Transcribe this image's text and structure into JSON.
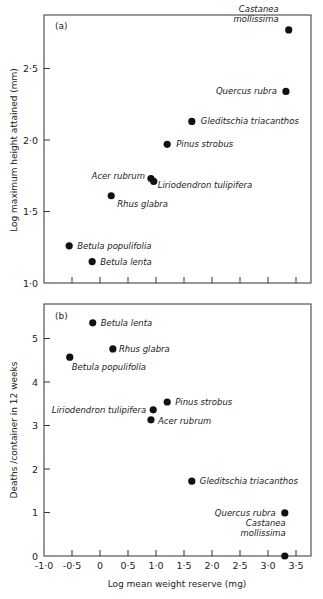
{
  "chart_data": [
    {
      "type": "scatter",
      "panel": "(a)",
      "title": "",
      "xlabel": "Log mean weight reserve (mg)",
      "ylabel": "Log maximum height attained (mm)",
      "xlim": [
        -1.0,
        3.75
      ],
      "ylim": [
        1.0,
        2.87
      ],
      "xticks": [
        -1.0,
        -0.5,
        0,
        0.5,
        1.0,
        1.5,
        2.0,
        2.5,
        3.0,
        3.5
      ],
      "yticks": [
        1.0,
        1.5,
        2.0,
        2.5
      ],
      "ytick_labels": [
        "1·0",
        "1·5",
        "2·0",
        "2·5"
      ],
      "grid": false,
      "legend": null,
      "points": [
        {
          "label": "Castanea mollissima",
          "label_lines": [
            "Castanea",
            "mollissima"
          ],
          "x": 3.37,
          "y": 2.77,
          "anchor": "end",
          "dx": -10,
          "dy": -8
        },
        {
          "label": "Quercus rubra",
          "label_lines": [
            "Quercus rubra"
          ],
          "x": 3.32,
          "y": 2.34,
          "anchor": "end",
          "dx": -9,
          "dy": 3
        },
        {
          "label": "Gleditschia triacanthos",
          "label_lines": [
            "Gleditschia triacanthos"
          ],
          "x": 1.64,
          "y": 2.13,
          "anchor": "start",
          "dx": 9,
          "dy": 3
        },
        {
          "label": "Pinus strobus",
          "label_lines": [
            "Pinus strobus"
          ],
          "x": 1.2,
          "y": 1.97,
          "anchor": "start",
          "dx": 9,
          "dy": 3
        },
        {
          "label": "Acer rubrum",
          "label_lines": [
            "Acer rubrum"
          ],
          "x": 0.91,
          "y": 1.73,
          "anchor": "end",
          "dx": -6,
          "dy": 0
        },
        {
          "label": "Liriodendron tulipifera",
          "label_lines": [
            "Liriodendron tulipifera"
          ],
          "x": 0.96,
          "y": 1.71,
          "anchor": "start",
          "dx": 4,
          "dy": 7
        },
        {
          "label": "Rhus glabra",
          "label_lines": [
            "Rhus glabra"
          ],
          "x": 0.2,
          "y": 1.61,
          "anchor": "start",
          "dx": 6,
          "dy": 11
        },
        {
          "label": "Betula populifolia",
          "label_lines": [
            "Betula populifolia"
          ],
          "x": -0.55,
          "y": 1.26,
          "anchor": "start",
          "dx": 8,
          "dy": 3
        },
        {
          "label": "Betula lenta",
          "label_lines": [
            "Betula lenta"
          ],
          "x": -0.14,
          "y": 1.15,
          "anchor": "start",
          "dx": 8,
          "dy": 3
        }
      ]
    },
    {
      "type": "scatter",
      "panel": "(b)",
      "title": "",
      "xlabel": "Log mean weight reserve (mg)",
      "ylabel": "Deaths /container in 12 weeks",
      "xlim": [
        -1.0,
        3.75
      ],
      "ylim": [
        0,
        5.8
      ],
      "xticks": [
        -1.0,
        -0.5,
        0,
        0.5,
        1.0,
        1.5,
        2.0,
        2.5,
        3.0,
        3.5
      ],
      "xtick_labels": [
        "-1·0",
        "-0·5",
        "0",
        "0·5",
        "1·0",
        "1·5",
        "2·0",
        "2·5",
        "3·0",
        "3·5"
      ],
      "yticks": [
        0,
        1,
        2,
        3,
        4,
        5
      ],
      "ytick_labels": [
        "0",
        "1",
        "2",
        "3",
        "4",
        "5"
      ],
      "grid": false,
      "legend": null,
      "points": [
        {
          "label": "Betula lenta",
          "label_lines": [
            "Betula lenta"
          ],
          "x": -0.13,
          "y": 5.36,
          "anchor": "start",
          "dx": 8,
          "dy": 3
        },
        {
          "label": "Rhus glabra",
          "label_lines": [
            "Rhus glabra"
          ],
          "x": 0.23,
          "y": 4.76,
          "anchor": "start",
          "dx": 6,
          "dy": 3
        },
        {
          "label": "Betula populifolia",
          "label_lines": [
            "Betula populifolia"
          ],
          "x": -0.54,
          "y": 4.57,
          "anchor": "start",
          "dx": 2,
          "dy": 13
        },
        {
          "label": "Pinus strobus",
          "label_lines": [
            "Pinus strobus"
          ],
          "x": 1.2,
          "y": 3.54,
          "anchor": "start",
          "dx": 8,
          "dy": 3
        },
        {
          "label": "Liriodendron tulipifera",
          "label_lines": [
            "Liriodendron tulipifera"
          ],
          "x": 0.95,
          "y": 3.36,
          "anchor": "end",
          "dx": -7,
          "dy": 3
        },
        {
          "label": "Acer rubrum",
          "label_lines": [
            "Acer rubrum"
          ],
          "x": 0.91,
          "y": 3.13,
          "anchor": "start",
          "dx": 7,
          "dy": 4
        },
        {
          "label": "Gleditschia triacanthos",
          "label_lines": [
            "Gleditschia triacanthos"
          ],
          "x": 1.64,
          "y": 1.72,
          "anchor": "start",
          "dx": 8,
          "dy": 3
        },
        {
          "label": "Quercus rubra",
          "label_lines": [
            "Quercus rubra"
          ],
          "x": 3.3,
          "y": 0.99,
          "anchor": "end",
          "dx": -9,
          "dy": 3
        },
        {
          "label": "Castanea mollissima",
          "label_lines": [
            "Castanea",
            "mollissima"
          ],
          "x": 3.3,
          "y": 0.0,
          "anchor": "end",
          "dx": 1,
          "dy": -20
        }
      ]
    }
  ],
  "colors": {
    "ink": "#222222",
    "frame": "#333333",
    "dot": "#111111",
    "background": "#ffffff"
  }
}
